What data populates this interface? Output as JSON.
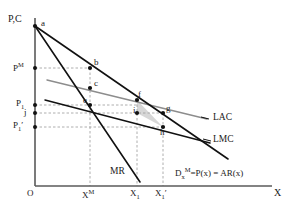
{
  "figure": {
    "axis": {
      "y_label": "P,C",
      "x_label": "X",
      "origin_label": "O"
    },
    "y_ticks": [
      {
        "id": "pm",
        "label_base": "P",
        "label_sup": "M",
        "label_prime": "",
        "y": 68
      },
      {
        "id": "p1",
        "label_base": "P",
        "label_sub": "1",
        "label_prime": "",
        "y": 105
      },
      {
        "id": "j",
        "label_base": "j",
        "label_sub": "",
        "label_prime": "",
        "y": 113
      },
      {
        "id": "p1prime",
        "label_base": "P",
        "label_sub": "1",
        "label_prime": "′",
        "y": 127
      }
    ],
    "x_ticks": [
      {
        "id": "xm",
        "label_base": "X",
        "label_sup": "M",
        "label_prime": "",
        "x": 90
      },
      {
        "id": "x1",
        "label_base": "X",
        "label_sub": "1",
        "label_prime": "",
        "x": 137
      },
      {
        "id": "x1prime",
        "label_base": "X",
        "label_sub": "1",
        "label_prime": "′",
        "x": 163
      }
    ],
    "points": [
      {
        "id": "a",
        "label": "a",
        "x": 35,
        "y": 26
      },
      {
        "id": "b",
        "label": "b",
        "x": 90,
        "y": 68
      },
      {
        "id": "c",
        "label": "c",
        "x": 90,
        "y": 88
      },
      {
        "id": "e",
        "label": "e",
        "x": 90,
        "y": 105
      },
      {
        "id": "f",
        "label": "f",
        "x": 137,
        "y": 100
      },
      {
        "id": "g",
        "label": "g",
        "x": 163,
        "y": 113
      },
      {
        "id": "i",
        "label": "i",
        "x": 137,
        "y": 113
      },
      {
        "id": "h",
        "label": "h",
        "x": 163,
        "y": 127
      }
    ],
    "curves": [
      {
        "id": "demand",
        "label_plain": "Dx M = P(x) = AR(x)"
      },
      {
        "id": "mr",
        "label": "MR"
      },
      {
        "id": "lac",
        "label": "LAC"
      },
      {
        "id": "lmc",
        "label": "LMC"
      }
    ],
    "demand_label": {
      "d": "D",
      "d_sub": "x",
      "d_sup": "M",
      "rest": "=P(x) = AR(x)"
    },
    "shaded_region": {
      "name": "welfare-loss-triangle",
      "vertices": "f, i, h"
    },
    "colors": {
      "line": "#111111",
      "guide": "#9a9a9a",
      "axis": "#5a5a5a",
      "shade": "#c9c9c9",
      "text": "#1a1a1a"
    }
  }
}
